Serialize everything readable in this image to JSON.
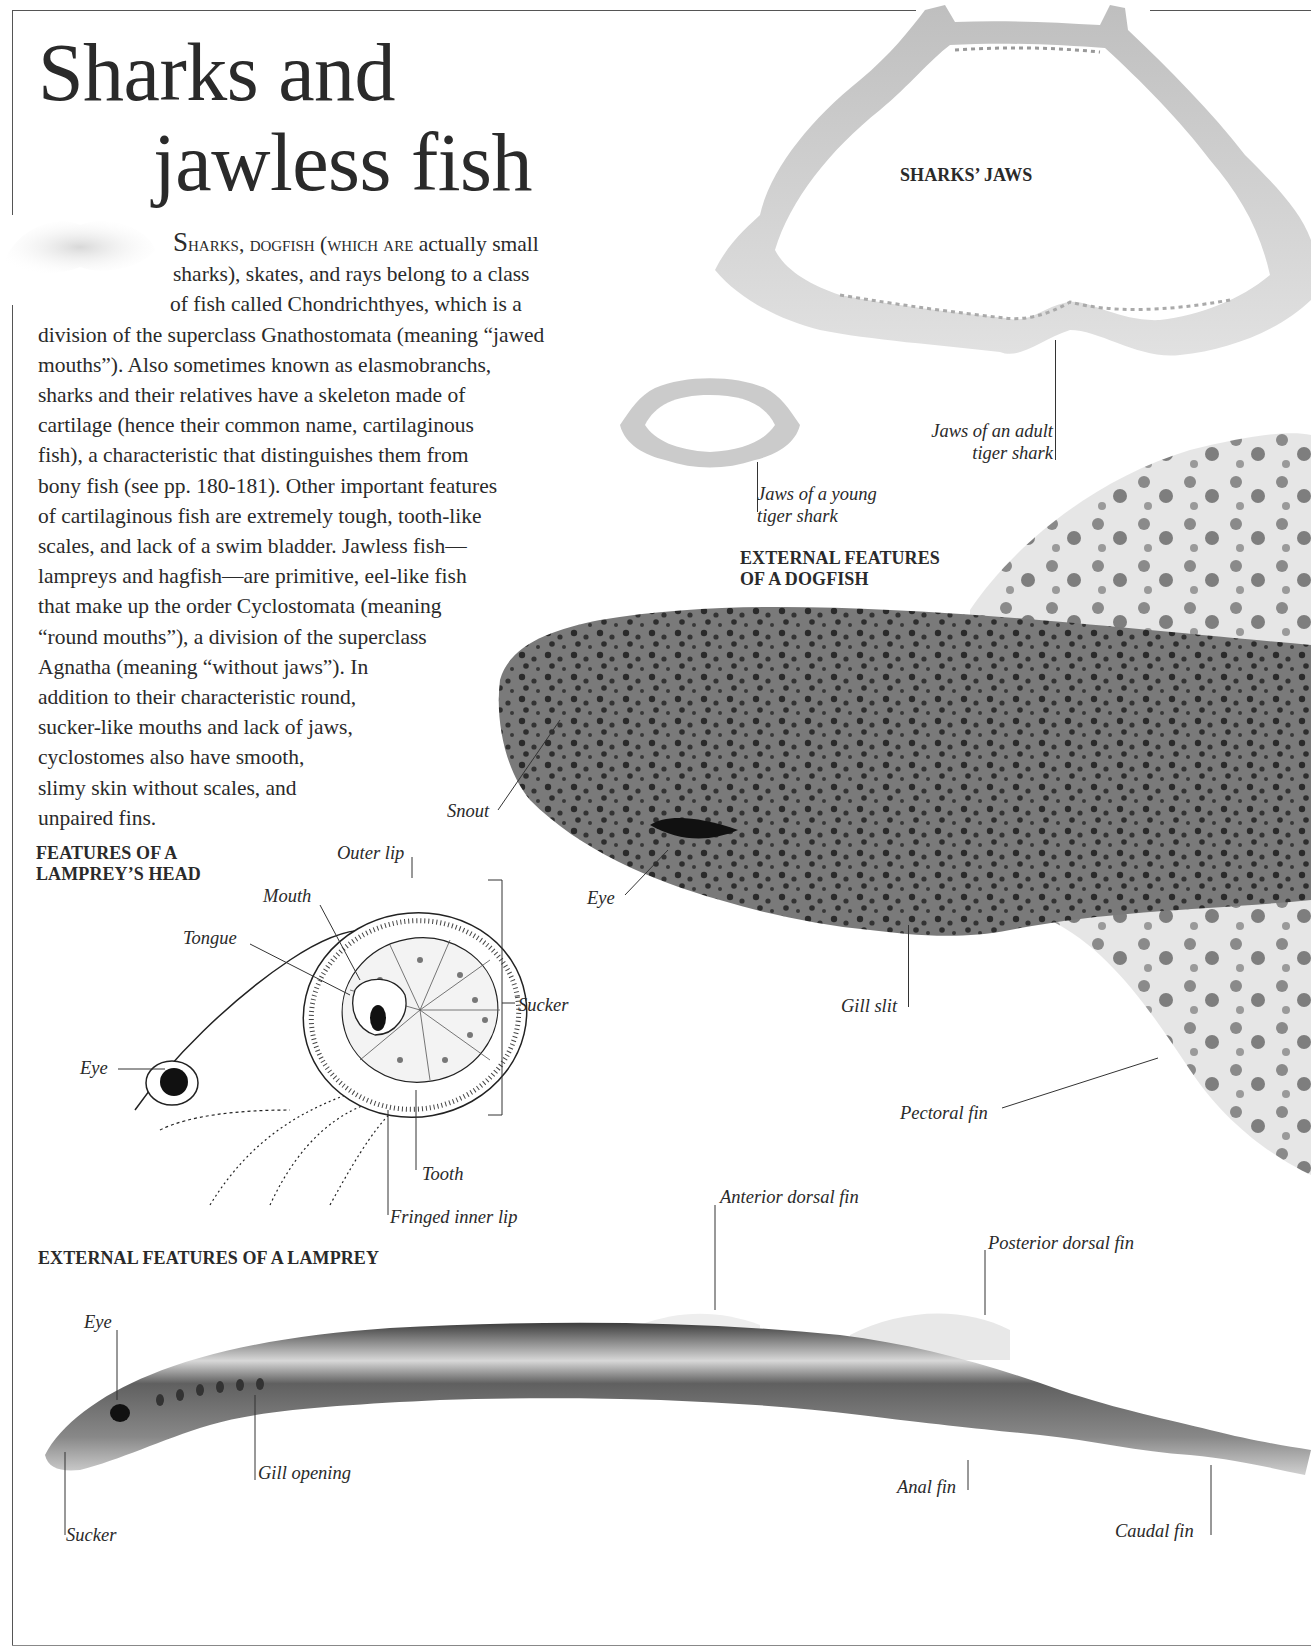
{
  "page": {
    "title_line1": "Sharks and",
    "title_line2": "jawless fish"
  },
  "intro": {
    "dropcap": "S",
    "smallcaps": "harks, dogfish (which are",
    "lines": [
      " actually small",
      "sharks), skates, and rays belong to a class",
      "of fish called Chondrichthyes, which is a",
      "division of the superclass Gnathostomata (meaning “jawed",
      "mouths”). Also sometimes known as elasmobranchs,",
      "sharks and their relatives have a skeleton made of",
      "cartilage (hence their common name, cartilaginous",
      "fish), a characteristic that distinguishes them from",
      "bony fish (see pp. 180-181). Other important features",
      "of cartilaginous fish are extremely tough, tooth-like",
      "scales, and lack of a swim bladder. Jawless fish—",
      "lampreys and hagfish—are primitive, eel-like fish",
      "that make up the order Cyclostomata (meaning",
      "“round mouths”), a division of the superclass",
      "Agnatha (meaning “without jaws”). In",
      "addition to their characteristic round,",
      "sucker-like mouths and lack of jaws,",
      "cyclostomes also have smooth,",
      "slimy skin without scales, and",
      "unpaired fins."
    ]
  },
  "sharks_jaws": {
    "heading": "SHARKS’ JAWS",
    "labels": {
      "adult_line1": "Jaws of an adult",
      "adult_line2": "tiger shark",
      "young_line1": "Jaws of a young",
      "young_line2": "tiger shark"
    }
  },
  "dogfish": {
    "heading_line1": "EXTERNAL FEATURES",
    "heading_line2": "OF A DOGFISH",
    "labels": {
      "snout": "Snout",
      "eye": "Eye",
      "gill_slit": "Gill slit",
      "pectoral_fin": "Pectoral fin"
    }
  },
  "lamprey_head": {
    "heading_line1": "FEATURES OF A",
    "heading_line2": "LAMPREY’S HEAD",
    "labels": {
      "outer_lip": "Outer lip",
      "mouth": "Mouth",
      "tongue": "Tongue",
      "sucker": "Sucker",
      "eye": "Eye",
      "tooth": "Tooth",
      "fringed_inner_lip": "Fringed inner lip"
    }
  },
  "lamprey": {
    "heading": "EXTERNAL FEATURES OF A LAMPREY",
    "labels": {
      "anterior_dorsal_fin": "Anterior dorsal fin",
      "posterior_dorsal_fin": "Posterior dorsal fin",
      "eye": "Eye",
      "gill_opening": "Gill opening",
      "sucker": "Sucker",
      "anal_fin": "Anal fin",
      "caudal_fin": "Caudal fin"
    }
  }
}
